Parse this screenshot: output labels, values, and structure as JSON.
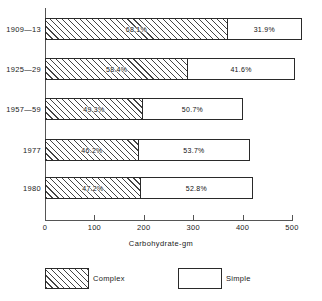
{
  "chart_data": {
    "type": "bar",
    "orientation": "horizontal",
    "stacked": true,
    "title": "",
    "xlabel": "Carbohydrate-gm",
    "ylabel": "",
    "xlim": [
      0,
      500
    ],
    "xticks": [
      0,
      100,
      200,
      300,
      400,
      500
    ],
    "xtick_labels": [
      "0",
      "100",
      "200",
      "300",
      "400",
      "500"
    ],
    "grid": false,
    "legend_position": "bottom",
    "categories": [
      "1909—13",
      "1925—29",
      "1957—59",
      "1977",
      "1980"
    ],
    "series": [
      {
        "name": "Complex",
        "values": [
          370,
          290,
          198,
          190,
          194
        ],
        "percent_labels": [
          "68.1%",
          "58.4%",
          "49.3%",
          "46.2%",
          "47.2%"
        ]
      },
      {
        "name": "Simple",
        "values": [
          150,
          216,
          204,
          225,
          227
        ],
        "percent_labels": [
          "31.9%",
          "41.6%",
          "50.7%",
          "53.7%",
          "52.8%"
        ]
      }
    ],
    "totals": [
      520,
      506,
      401,
      415,
      421
    ]
  },
  "axis": {
    "x_title": "Carbohydrate-gm",
    "ticks": [
      {
        "label": "0",
        "value": 0
      },
      {
        "label": "100",
        "value": 100
      },
      {
        "label": "200",
        "value": 200
      },
      {
        "label": "300",
        "value": 300
      },
      {
        "label": "400",
        "value": 400
      },
      {
        "label": "500",
        "value": 500
      }
    ]
  },
  "rows": [
    {
      "label": "1909—13",
      "complex_percent": "68.1%",
      "simple_percent": "31.9%",
      "complex_value": 370,
      "simple_value": 150,
      "total": 520
    },
    {
      "label": "1925—29",
      "complex_percent": "58.4%",
      "simple_percent": "41.6%",
      "complex_value": 290,
      "simple_value": 216,
      "total": 506
    },
    {
      "label": "1957—59",
      "complex_percent": "49.3%",
      "simple_percent": "50.7%",
      "complex_value": 198,
      "simple_value": 204,
      "total": 401
    },
    {
      "label": "1977",
      "complex_percent": "46.2%",
      "simple_percent": "53.7%",
      "complex_value": 190,
      "simple_value": 225,
      "total": 415
    },
    {
      "label": "1980",
      "complex_percent": "47.2%",
      "simple_percent": "52.8%",
      "complex_value": 194,
      "simple_value": 227,
      "total": 421
    }
  ],
  "legend": {
    "complex_label": "Complex",
    "simple_label": "Simple"
  },
  "colors": {
    "line": "#2a2a2a",
    "axis": "#555555",
    "hatch": "#444444",
    "fill": "#ffffff",
    "text": "#1a1a1a"
  }
}
